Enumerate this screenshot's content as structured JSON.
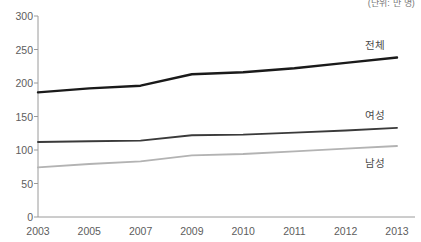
{
  "unit_note": "(단위: 만 명)",
  "colors": {
    "total_line": "#1a1a1a",
    "female_line": "#3a3a3a",
    "male_line": "#b3b3b3",
    "axis": "#9a9a9a",
    "tick_text": "#5d5d5d",
    "label_text": "#4a4a4a",
    "background": "#ffffff"
  },
  "axes": {
    "y_ticks": [
      "0",
      "50",
      "100",
      "150",
      "200",
      "250",
      "300"
    ],
    "x_ticks": [
      "2003",
      "2005",
      "2007",
      "2009",
      "2010",
      "2011",
      "2012",
      "2013"
    ]
  },
  "series_labels": {
    "total": "전체",
    "female": "여성",
    "male": "남성"
  },
  "chart_data": {
    "type": "line",
    "title": "",
    "subtitle": "",
    "xlabel": "",
    "ylabel": "",
    "unit": "(단위: 만 명)",
    "grid": false,
    "legend_position": "inline-right",
    "categories": [
      "2003",
      "2005",
      "2007",
      "2009",
      "2010",
      "2011",
      "2012",
      "2013"
    ],
    "x": [
      2003,
      2005,
      2007,
      2009,
      2010,
      2011,
      2012,
      2013
    ],
    "ylim": [
      0,
      300
    ],
    "ytick_interval": 50,
    "series": [
      {
        "name": "전체",
        "color": "#1a1a1a",
        "values": [
          186,
          192,
          196,
          213,
          216,
          222,
          230,
          238
        ]
      },
      {
        "name": "여성",
        "color": "#3a3a3a",
        "values": [
          112,
          113,
          114,
          122,
          123,
          126,
          129,
          133
        ]
      },
      {
        "name": "남성",
        "color": "#b3b3b3",
        "values": [
          74,
          79,
          83,
          92,
          94,
          98,
          102,
          106
        ]
      }
    ]
  }
}
